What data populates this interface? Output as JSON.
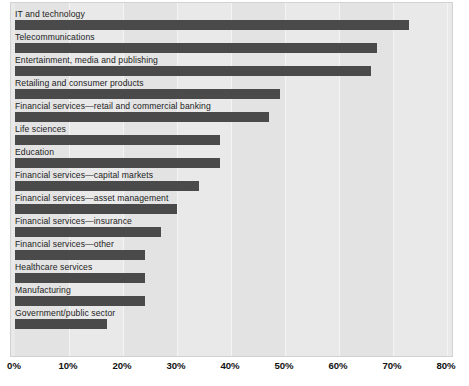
{
  "chart_data": {
    "type": "bar",
    "orientation": "horizontal",
    "title": "",
    "subtitle": "",
    "xlabel": "",
    "ylabel": "",
    "xlim": [
      0,
      80
    ],
    "xunit": "%",
    "grid": true,
    "legend": null,
    "legend_position": "none",
    "bar_color": "#4a4a4a",
    "plot_background": "#e9e9e9",
    "xticks": [
      0,
      10,
      20,
      30,
      40,
      50,
      60,
      70,
      80
    ],
    "xtick_labels": [
      "0%",
      "10%",
      "20%",
      "30%",
      "40%",
      "50%",
      "60%",
      "70%",
      "80%"
    ],
    "categories": [
      "IT and technology",
      "Telecommunications",
      "Entertainment, media and publishing",
      "Retailing and consumer products",
      "Financial services—retail and commercial banking",
      "Life sciences",
      "Education",
      "Financial services—capital markets",
      "Financial services—asset management",
      "Financial services—insurance",
      "Financial services—other",
      "Healthcare services",
      "Manufacturing",
      "Government/public sector"
    ],
    "values": [
      73,
      67,
      66,
      49,
      47,
      38,
      38,
      34,
      30,
      27,
      24,
      24,
      24,
      17
    ]
  }
}
